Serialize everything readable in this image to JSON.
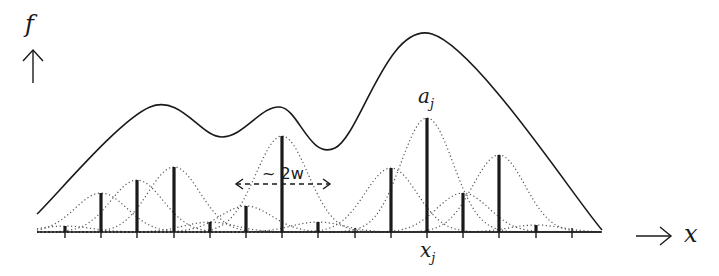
{
  "labels": {
    "y_axis": "f",
    "x_axis": "x",
    "amplitude": "a",
    "amplitude_sub": "j",
    "position": "x",
    "position_sub": "j",
    "width_annotation": "~ 2w",
    "y_arrow": "↑",
    "x_arrow": "⟶"
  },
  "colors": {
    "ink": "#1a1a1a",
    "dotted": "#555555",
    "background": "#ffffff"
  },
  "chart_data": {
    "type": "line",
    "title": "",
    "xlabel": "x",
    "ylabel": "f",
    "grid": false,
    "axis_y_px": 232,
    "axis_x_range_px": [
      37,
      602
    ],
    "tick_positions_px": [
      65,
      101,
      137,
      174,
      210,
      246,
      282,
      318,
      355,
      391,
      427,
      463,
      499,
      536,
      572
    ],
    "bars": [
      {
        "x": 65,
        "top": 226
      },
      {
        "x": 101,
        "top": 193
      },
      {
        "x": 137,
        "top": 180
      },
      {
        "x": 174,
        "top": 167
      },
      {
        "x": 210,
        "top": 222
      },
      {
        "x": 246,
        "top": 206
      },
      {
        "x": 282,
        "top": 136
      },
      {
        "x": 318,
        "top": 222
      },
      {
        "x": 355,
        "top": 232
      },
      {
        "x": 391,
        "top": 168
      },
      {
        "x": 427,
        "top": 118
      },
      {
        "x": 463,
        "top": 193
      },
      {
        "x": 499,
        "top": 155
      },
      {
        "x": 536,
        "top": 225
      },
      {
        "x": 572,
        "top": 232
      }
    ],
    "highlighted_bar_index": 10,
    "kernel_sigma_px": 26,
    "sum_curve_keypoints": [
      {
        "x": 37,
        "y": 214
      },
      {
        "x": 150,
        "y": 107
      },
      {
        "x": 222,
        "y": 137
      },
      {
        "x": 280,
        "y": 107
      },
      {
        "x": 335,
        "y": 148
      },
      {
        "x": 432,
        "y": 34
      },
      {
        "x": 602,
        "y": 230
      }
    ],
    "width_arrow": {
      "x1": 236,
      "x2": 330,
      "y": 184
    }
  }
}
